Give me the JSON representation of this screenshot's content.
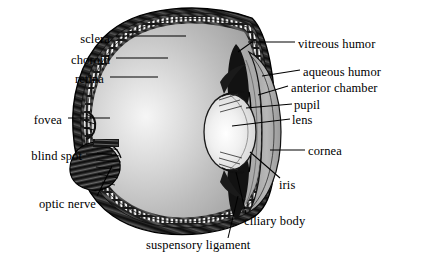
{
  "figure": {
    "type": "anatomical-cross-section",
    "orientation": "left-facing profile, cornea at right",
    "background_color": "#ffffff",
    "ink_color": "#000000"
  },
  "palette": {
    "sclera_outer": "#1c1c1c",
    "choroid": "#3a3a3a",
    "retina_stipple": "#f2f2f2",
    "vitreous_light": "#f4f4f4",
    "vitreous_mid": "#b9b9b9",
    "vitreous_edge": "#9a9a9a",
    "aqueous": "#a8a8a8",
    "cornea": "#b5b5b5",
    "lens_light": "#fbfbfb",
    "lens_mid": "#e2e2e2",
    "iris_dark": "#141414",
    "optic_nerve": "#2b2b2b"
  },
  "labels": [
    {
      "id": "sclera",
      "text": "sclera",
      "side": "left",
      "x": 110,
      "y": 40,
      "leader_to_x": 186,
      "leader_to_y": 36
    },
    {
      "id": "choroid",
      "text": "choroid",
      "side": "left",
      "x": 80,
      "y": 61,
      "leader_to_x": 168,
      "leader_to_y": 59
    },
    {
      "id": "retina",
      "text": "retina",
      "side": "left",
      "x": 76,
      "y": 80,
      "leader_to_x": 158,
      "leader_to_y": 79
    },
    {
      "id": "fovea",
      "text": "fovea",
      "side": "left",
      "x": 62,
      "y": 121,
      "leader_to_x": 113,
      "leader_to_y": 119
    },
    {
      "id": "blind-spot",
      "text": "blind spot",
      "side": "left",
      "x": 82,
      "y": 157,
      "leader_to_x": 113,
      "leader_to_y": 155
    },
    {
      "id": "optic-nerve",
      "text": "optic nerve",
      "side": "left",
      "x": 92,
      "y": 205,
      "leader_to_x": 113,
      "leader_to_y": 170
    },
    {
      "id": "vitreous-humor",
      "text": "vitreous humor",
      "side": "right",
      "x": 299,
      "y": 45,
      "leader_to_x": 249,
      "leader_to_y": 45
    },
    {
      "id": "aqueous-humor",
      "text": "aqueous humor",
      "side": "right",
      "x": 305,
      "y": 74,
      "leader_to_x": 265,
      "leader_to_y": 78
    },
    {
      "id": "anterior-chamber",
      "text": "anterior chamber",
      "side": "right",
      "x": 333,
      "y": 89,
      "leader_to_x": 264,
      "leader_to_y": 96
    },
    {
      "id": "pupil",
      "text": "pupil",
      "side": "right",
      "x": 308,
      "y": 108,
      "leader_to_x": 258,
      "leader_to_y": 110
    },
    {
      "id": "lens",
      "text": "lens",
      "side": "right",
      "x": 296,
      "y": 123,
      "leader_to_x": 234,
      "leader_to_y": 124
    },
    {
      "id": "cornea",
      "text": "cornea",
      "side": "right",
      "x": 312,
      "y": 154,
      "leader_to_x": 272,
      "leader_to_y": 150
    },
    {
      "id": "iris",
      "text": "iris",
      "side": "right",
      "x": 288,
      "y": 187,
      "leader_to_x": 256,
      "leader_to_y": 160
    },
    {
      "id": "ciliary-body",
      "text": "ciliary body",
      "side": "right",
      "x": 243,
      "y": 223,
      "leader_to_x": 248,
      "leader_to_y": 178
    },
    {
      "id": "suspensory-ligament",
      "text": "suspensory ligament",
      "side": "bottom",
      "x": 148,
      "y": 248,
      "leader_to_x": 228,
      "leader_to_y": 205
    }
  ]
}
